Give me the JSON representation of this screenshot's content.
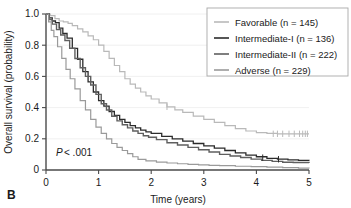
{
  "panel": {
    "label": "B"
  },
  "chart_data": {
    "type": "line",
    "title": "",
    "subtitle": "",
    "xlabel": "Time (years)",
    "ylabel": "Overall survival (probability)",
    "xlim": [
      0,
      5
    ],
    "ylim": [
      0,
      1.0
    ],
    "xticks": [
      "0",
      "1",
      "2",
      "3",
      "4",
      "5"
    ],
    "xtick_values": [
      0,
      1,
      2,
      3,
      4,
      5
    ],
    "yticks": [
      "0",
      "0.2",
      "0.4",
      "0.6",
      "0.8",
      "1.0"
    ],
    "ytick_values": [
      0,
      0.2,
      0.4,
      0.6,
      0.8,
      1.0
    ],
    "grid": "horizontal-faint",
    "legend_position": "top-right",
    "annotations": [
      {
        "name": "p-value",
        "text_italic": "P",
        "text_rest": " < .001",
        "x": 0.12,
        "y": 0.11
      }
    ],
    "series": [
      {
        "name": "Favorable (n = 145)",
        "group": "Favorable",
        "n": 145,
        "color": "#b9b9b9",
        "width": 1.2,
        "x": [
          0,
          0.08,
          0.17,
          0.25,
          0.33,
          0.42,
          0.5,
          0.6,
          0.7,
          0.8,
          0.9,
          1.0,
          1.1,
          1.2,
          1.3,
          1.4,
          1.5,
          1.6,
          1.7,
          1.8,
          1.9,
          2.0,
          2.15,
          2.3,
          2.45,
          2.6,
          2.8,
          3.0,
          3.2,
          3.4,
          3.6,
          3.8,
          4.0,
          4.2,
          4.4,
          4.6,
          4.8,
          5.0
        ],
        "y": [
          1.0,
          0.99,
          0.97,
          0.955,
          0.95,
          0.94,
          0.925,
          0.905,
          0.885,
          0.86,
          0.835,
          0.8,
          0.76,
          0.715,
          0.67,
          0.63,
          0.585,
          0.55,
          0.525,
          0.5,
          0.475,
          0.455,
          0.43,
          0.405,
          0.385,
          0.37,
          0.345,
          0.325,
          0.305,
          0.285,
          0.265,
          0.25,
          0.24,
          0.235,
          0.232,
          0.232,
          0.232,
          0.232
        ],
        "censor_x": [
          2.3,
          4.32,
          4.4,
          4.5,
          4.62,
          4.72,
          4.82,
          4.88,
          4.93,
          4.97
        ],
        "censor_y": [
          0.405,
          0.232,
          0.232,
          0.232,
          0.232,
          0.232,
          0.232,
          0.232,
          0.232,
          0.232
        ]
      },
      {
        "name": "Intermediate-I (n = 136)",
        "group": "Intermediate-I",
        "n": 136,
        "color": "#2b2b2b",
        "width": 1.3,
        "x": [
          0,
          0.06,
          0.12,
          0.18,
          0.25,
          0.32,
          0.4,
          0.5,
          0.6,
          0.7,
          0.8,
          0.9,
          1.0,
          1.1,
          1.2,
          1.3,
          1.4,
          1.5,
          1.6,
          1.7,
          1.8,
          1.9,
          2.0,
          2.2,
          2.4,
          2.6,
          2.8,
          3.0,
          3.2,
          3.4,
          3.6,
          3.8,
          4.0,
          4.2,
          4.4,
          4.6,
          4.8,
          5.0
        ],
        "y": [
          1.0,
          0.975,
          0.955,
          0.945,
          0.91,
          0.875,
          0.845,
          0.78,
          0.71,
          0.63,
          0.565,
          0.5,
          0.445,
          0.41,
          0.375,
          0.35,
          0.325,
          0.305,
          0.285,
          0.27,
          0.255,
          0.245,
          0.235,
          0.215,
          0.2,
          0.185,
          0.17,
          0.155,
          0.14,
          0.125,
          0.11,
          0.095,
          0.085,
          0.075,
          0.07,
          0.065,
          0.062,
          0.06
        ],
        "censor_x": [
          4.12,
          4.42
        ],
        "censor_y": [
          0.079,
          0.069
        ]
      },
      {
        "name": "Intermediate-II (n = 222)",
        "group": "Intermediate-II",
        "n": 222,
        "color": "#5f5f5f",
        "width": 1.4,
        "x": [
          0,
          0.06,
          0.12,
          0.2,
          0.28,
          0.36,
          0.45,
          0.55,
          0.65,
          0.75,
          0.85,
          0.95,
          1.05,
          1.15,
          1.25,
          1.35,
          1.45,
          1.55,
          1.65,
          1.75,
          1.85,
          1.95,
          2.1,
          2.3,
          2.5,
          2.7,
          2.9,
          3.1,
          3.3,
          3.5,
          3.7,
          3.9,
          4.1,
          4.3,
          4.5,
          4.7,
          5.0
        ],
        "y": [
          1.0,
          0.965,
          0.935,
          0.9,
          0.865,
          0.83,
          0.78,
          0.715,
          0.655,
          0.6,
          0.545,
          0.485,
          0.425,
          0.385,
          0.345,
          0.315,
          0.29,
          0.27,
          0.25,
          0.235,
          0.22,
          0.21,
          0.195,
          0.175,
          0.16,
          0.145,
          0.13,
          0.115,
          0.1,
          0.09,
          0.08,
          0.07,
          0.062,
          0.055,
          0.05,
          0.048,
          0.045
        ],
        "censor_x": [],
        "censor_y": []
      },
      {
        "name": "Adverse (n = 229)",
        "group": "Adverse",
        "n": 229,
        "color": "#9a9a9a",
        "width": 1.2,
        "x": [
          0,
          0.05,
          0.1,
          0.15,
          0.22,
          0.3,
          0.38,
          0.46,
          0.55,
          0.65,
          0.75,
          0.85,
          0.95,
          1.05,
          1.15,
          1.25,
          1.35,
          1.45,
          1.55,
          1.65,
          1.75,
          1.9,
          2.1,
          2.3,
          2.5,
          2.7,
          2.9,
          3.1,
          3.3,
          3.6,
          3.9,
          4.2,
          4.5,
          4.8,
          5.0
        ],
        "y": [
          1.0,
          0.95,
          0.895,
          0.855,
          0.79,
          0.715,
          0.645,
          0.585,
          0.52,
          0.445,
          0.385,
          0.325,
          0.275,
          0.235,
          0.2,
          0.17,
          0.145,
          0.125,
          0.105,
          0.085,
          0.068,
          0.058,
          0.05,
          0.045,
          0.04,
          0.036,
          0.033,
          0.03,
          0.028,
          0.024,
          0.021,
          0.018,
          0.015,
          0.012,
          0.01
        ],
        "censor_x": [],
        "censor_y": []
      }
    ]
  },
  "legend": {
    "items": [
      {
        "label": "Favorable (n = 145)",
        "color": "#b9b9b9"
      },
      {
        "label": "Intermediate-I (n = 136)",
        "color": "#2b2b2b"
      },
      {
        "label": "Intermediate-II (n = 222)",
        "color": "#5f5f5f"
      },
      {
        "label": "Adverse (n = 229)",
        "color": "#9a9a9a"
      }
    ],
    "border_color": "#a8a8a8"
  }
}
